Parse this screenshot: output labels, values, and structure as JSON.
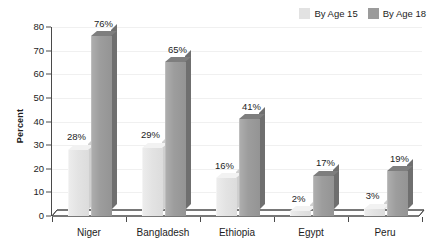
{
  "chart_data": {
    "type": "bar",
    "title": "",
    "xlabel": "",
    "ylabel": "Percent",
    "ylim": [
      0,
      80
    ],
    "ytick_step": 10,
    "yticks": [
      0,
      10,
      20,
      30,
      40,
      50,
      60,
      70,
      80
    ],
    "grid": true,
    "legend_position": "top-right",
    "categories": [
      "Niger",
      "Bangladesh",
      "Ethiopia",
      "Egypt",
      "Peru"
    ],
    "series": [
      {
        "name": "By Age 15",
        "color": "#e2e2e2",
        "values": [
          28,
          29,
          16,
          2,
          3
        ],
        "labels": [
          "28%",
          "29%",
          "16%",
          "2%",
          "3%"
        ]
      },
      {
        "name": "By Age 18",
        "color": "#9b9b9b",
        "values": [
          76,
          65,
          41,
          17,
          19
        ],
        "labels": [
          "76%",
          "65%",
          "41%",
          "17%",
          "19%"
        ]
      }
    ]
  },
  "axis": {
    "y_title": "Percent",
    "y_tick_labels": [
      "80",
      "70",
      "60",
      "50",
      "40",
      "30",
      "20",
      "10",
      "0"
    ]
  },
  "legend": {
    "items": [
      {
        "label": "By Age 15",
        "color": "#e2e2e2"
      },
      {
        "label": "By Age 18",
        "color": "#9b9b9b"
      }
    ]
  }
}
